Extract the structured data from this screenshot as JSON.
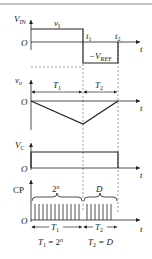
{
  "diagram": {
    "colors": {
      "line": "#222222",
      "dash": "#555555",
      "rule": "#888888",
      "background": "#ffffff"
    },
    "panels": {
      "vin": {
        "axis_label": "V",
        "axis_sub": "IN",
        "origin": "O",
        "t_axis": "t",
        "high_label": "v",
        "high_sub": "I",
        "low_label": "−V",
        "low_sub": "REF",
        "t1_label": "t",
        "t1_sub": "1",
        "t2_label": "t",
        "t2_sub": "2"
      },
      "vo": {
        "axis_label": "v",
        "axis_sub": "o",
        "origin": "O",
        "t_axis": "t",
        "span1_label": "T",
        "span1_sub": "1",
        "span2_label": "T",
        "span2_sub": "2"
      },
      "vc": {
        "axis_label": "V",
        "axis_sub": "C",
        "origin": "O",
        "t_axis": "t"
      },
      "cp": {
        "axis_label": "CP",
        "origin": "O",
        "t_axis": "t",
        "brace1_label": "2",
        "brace1_sup": "n",
        "brace2_label": "D",
        "span1_label": "T",
        "span1_sub": "1",
        "span2_label": "T",
        "span2_sub": "2",
        "pulses_in_T1": 12,
        "pulses_in_T2": 7,
        "eq1": {
          "lhs": "T",
          "lhs_sub": "1",
          "eq": " = 2",
          "sup": "n"
        },
        "eq2": {
          "lhs": "T",
          "lhs_sub": "2",
          "eq": " = D"
        }
      }
    }
  }
}
